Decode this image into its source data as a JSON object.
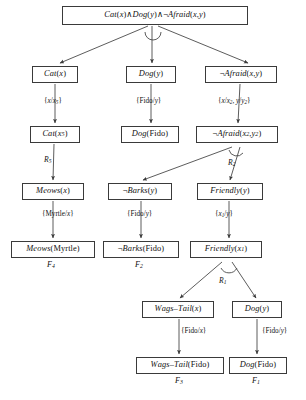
{
  "diagram": {
    "type": "proof-tree",
    "colors": {
      "box_border": "#3a3a3a",
      "line": "#4a4a4a",
      "text": "#111111",
      "background": "#ffffff"
    },
    "nodes": [
      {
        "id": "root",
        "text": "Cat(x)∧Dog( y)∧¬Afraid(x, y)",
        "x": 62,
        "y": 6,
        "w": 186,
        "h": 19
      },
      {
        "id": "cat_x",
        "text": "Cat(x)",
        "x": 32,
        "y": 66,
        "w": 46,
        "h": 17
      },
      {
        "id": "dog_y",
        "text": "Dog( y)",
        "x": 126,
        "y": 66,
        "w": 50,
        "h": 17
      },
      {
        "id": "afraid_xy",
        "text": "¬Afraid(x, y)",
        "x": 205,
        "y": 66,
        "w": 72,
        "h": 17
      },
      {
        "id": "cat_x5",
        "text": "Cat(x₅)",
        "x": 30,
        "y": 126,
        "w": 50,
        "h": 17
      },
      {
        "id": "dog_fido_1",
        "text": "Dog(Fido)",
        "x": 121,
        "y": 126,
        "w": 58,
        "h": 17
      },
      {
        "id": "afraid_x2y2",
        "text": "¬Afraid(x₂, y₂)",
        "x": 196,
        "y": 126,
        "w": 82,
        "h": 17
      },
      {
        "id": "meows_x",
        "text": "Meows(x)",
        "x": 22,
        "y": 183,
        "w": 62,
        "h": 17
      },
      {
        "id": "barks_y",
        "text": "¬Barks( y)",
        "x": 108,
        "y": 183,
        "w": 64,
        "h": 17
      },
      {
        "id": "friendly_y",
        "text": "Friendly( y)",
        "x": 197,
        "y": 183,
        "w": 66,
        "h": 17
      },
      {
        "id": "meows_myrtle",
        "text": "Meows(Myrtle)",
        "x": 11,
        "y": 241,
        "w": 84,
        "h": 17
      },
      {
        "id": "barks_fido",
        "text": "¬Barks(Fido)",
        "x": 103,
        "y": 241,
        "w": 76,
        "h": 17
      },
      {
        "id": "friendly_x1",
        "text": "Friendly(x₁)",
        "x": 190,
        "y": 241,
        "w": 72,
        "h": 17
      },
      {
        "id": "wags_tail_x",
        "text": "Wags–Tail(x)",
        "x": 142,
        "y": 301,
        "w": 72,
        "h": 17
      },
      {
        "id": "dog_y_2",
        "text": "Dog( y)",
        "x": 232,
        "y": 301,
        "w": 50,
        "h": 17
      },
      {
        "id": "wags_tail_fido",
        "text": "Wags–Tail(Fido)",
        "x": 136,
        "y": 357,
        "w": 88,
        "h": 17
      },
      {
        "id": "dog_fido_2",
        "text": "Dog(Fido)",
        "x": 229,
        "y": 357,
        "w": 58,
        "h": 17
      }
    ],
    "substitution_labels": [
      {
        "id": "sub_x_x5",
        "text": "{x/x₅}",
        "x": 44,
        "y": 98
      },
      {
        "id": "sub_fido_y_1",
        "text": "{Fido/y}",
        "x": 136,
        "y": 98
      },
      {
        "id": "sub_x_x2_y_y2",
        "text": "{x/x₂, y/y₂}",
        "x": 218,
        "y": 98
      },
      {
        "id": "sub_myrtle_x",
        "text": "{Myrtle/x}",
        "x": 42,
        "y": 211
      },
      {
        "id": "sub_fido_y_2",
        "text": "{Fido/y}",
        "x": 127,
        "y": 211
      },
      {
        "id": "sub_x1_y",
        "text": "{x₁/y}",
        "x": 215,
        "y": 211
      },
      {
        "id": "sub_fido_x",
        "text": "{Fido/x}",
        "x": 181,
        "y": 328
      },
      {
        "id": "sub_fido_y_3",
        "text": "{Fido/y}",
        "x": 262,
        "y": 328
      }
    ],
    "rule_labels": [
      {
        "id": "r5",
        "text": "R₅",
        "x": 44,
        "y": 156
      },
      {
        "id": "r2",
        "text": "R₂",
        "x": 228,
        "y": 159
      },
      {
        "id": "r1",
        "text": "R₁",
        "x": 219,
        "y": 277
      }
    ],
    "leaf_labels": [
      {
        "id": "f4",
        "text": "F₄",
        "x": 47,
        "y": 261
      },
      {
        "id": "f2",
        "text": "F₂",
        "x": 135,
        "y": 261
      },
      {
        "id": "f3",
        "text": "F₃",
        "x": 175,
        "y": 377
      },
      {
        "id": "f1",
        "text": "F₁",
        "x": 252,
        "y": 377
      }
    ],
    "edges": [
      {
        "id": "e_root_cat",
        "from": "root",
        "to": "cat_x",
        "path": "M 148 26 L 60 63",
        "arrow": true
      },
      {
        "id": "e_root_dog",
        "from": "root",
        "to": "dog_y",
        "path": "M 152 26 L 152 63",
        "arrow": true
      },
      {
        "id": "e_root_afraid",
        "from": "root",
        "to": "afraid_xy",
        "path": "M 158 26 L 248 63",
        "arrow": true
      },
      {
        "id": "e_cat_cat5",
        "from": "cat_x",
        "to": "cat_x5",
        "path": "M 55 84 L 55 123",
        "arrow": true
      },
      {
        "id": "e_dog_dogfido",
        "from": "dog_y",
        "to": "dog_fido_1",
        "path": "M 151 84 L 151 123",
        "arrow": true
      },
      {
        "id": "e_afraid_afraid22",
        "from": "afraid_xy",
        "to": "afraid_x2y2",
        "path": "M 240 84 L 238 123",
        "arrow": true
      },
      {
        "id": "e_cat5_meows",
        "from": "cat_x5",
        "to": "meows_x",
        "path": "M 54 144 L 53 180",
        "arrow": true
      },
      {
        "id": "e_afraid22_barks",
        "from": "afraid_x2y2",
        "to": "barks_y",
        "path": "M 232 147 L 143 180",
        "arrow": true
      },
      {
        "id": "e_afraid22_friendly",
        "from": "afraid_x2y2",
        "to": "friendly_y",
        "path": "M 240 147 L 230 180",
        "arrow": true
      },
      {
        "id": "e_meows_myrtle",
        "from": "meows_x",
        "to": "meows_myrtle",
        "path": "M 53 201 L 53 238",
        "arrow": true
      },
      {
        "id": "e_barks_fido",
        "from": "barks_y",
        "to": "barks_fido",
        "path": "M 141 201 L 141 238",
        "arrow": true
      },
      {
        "id": "e_friendly_x1",
        "from": "friendly_y",
        "to": "friendly_x1",
        "path": "M 229 201 L 229 238",
        "arrow": true
      },
      {
        "id": "e_friendly_wags",
        "from": "friendly_x1",
        "to": "wags_tail_x",
        "path": "M 222 262 L 180 298",
        "arrow": true
      },
      {
        "id": "e_friendly_dog",
        "from": "friendly_x1",
        "to": "dog_y_2",
        "path": "M 232 262 L 256 298",
        "arrow": true
      },
      {
        "id": "e_wags_wagsfido",
        "from": "wags_tail_x",
        "to": "wags_tail_fido",
        "path": "M 179 319 L 179 354",
        "arrow": true
      },
      {
        "id": "e_dog_dogfido2",
        "from": "dog_y_2",
        "to": "dog_fido_2",
        "path": "M 257 319 L 257 354",
        "arrow": true
      }
    ],
    "arcs": [
      {
        "id": "arc_root",
        "d": "M 145 32 A 8 8 0 0 0 161 32"
      },
      {
        "id": "arc_afraid",
        "d": "M 229 150 A 8 8 0 0 0 243 153"
      },
      {
        "id": "arc_friendly",
        "d": "M 221 268 A 9 9 0 0 0 237 268"
      }
    ]
  }
}
